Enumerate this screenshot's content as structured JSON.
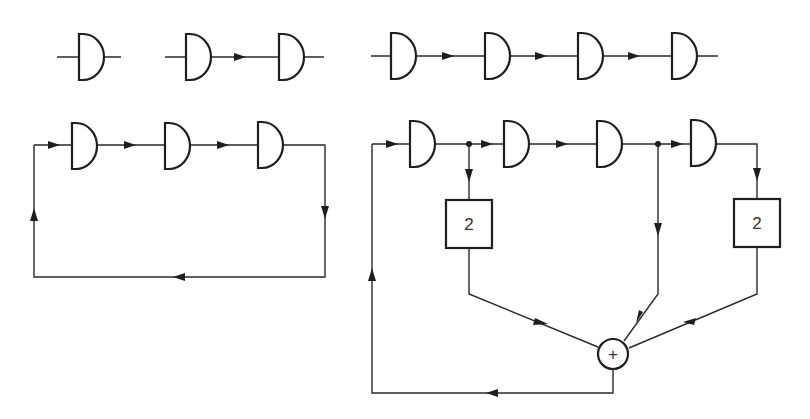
{
  "diagram": {
    "type": "shift-register / delay-element circuits",
    "colors": {
      "line": "#1e1e1e",
      "background": "#ffffff"
    },
    "row1": {
      "single_delay": {
        "elements": 1
      },
      "chain_of_two": {
        "elements": 2
      },
      "chain_of_four": {
        "elements": 4
      }
    },
    "cyclic_register": {
      "elements": 3,
      "feedback": "output of last element fed back to input"
    },
    "feedback_register": {
      "elements": 4,
      "taps": [
        {
          "from": "after element 1",
          "multiplier_label": "2"
        },
        {
          "from": "after element 3",
          "multiplier_label": ""
        },
        {
          "from": "after element 4",
          "multiplier_label": "2"
        }
      ],
      "multiplier_box_1": "2",
      "multiplier_box_2": "2",
      "adder_symbol": "+",
      "feedback": "adder output fed back to input of element 1"
    }
  }
}
